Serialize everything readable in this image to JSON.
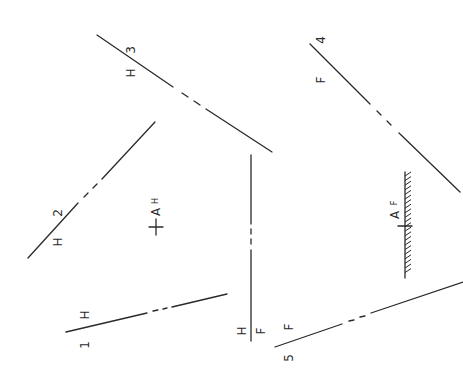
{
  "figure": {
    "lines": [
      {
        "id": "1",
        "number_label": "1",
        "view_label": "H"
      },
      {
        "id": "2",
        "number_label": "2",
        "view_label": "H"
      },
      {
        "id": "3",
        "number_label": "3",
        "view_label": "H"
      },
      {
        "id": "4",
        "number_label": "4",
        "view_label": "F"
      },
      {
        "id": "5",
        "number_label": "5",
        "view_label": "F"
      }
    ],
    "fold_line": {
      "top_label": "H",
      "bottom_label": "F"
    },
    "point_h": {
      "label": "A",
      "subscript": "H"
    },
    "point_f": {
      "label": "A",
      "subscript": "F"
    }
  }
}
